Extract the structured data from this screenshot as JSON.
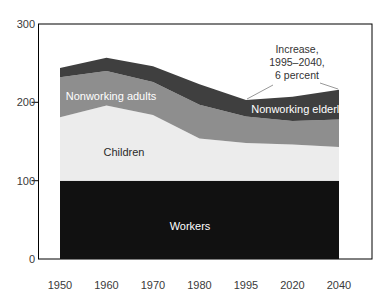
{
  "chart_data": {
    "type": "area",
    "stacked": true,
    "title": "",
    "categories": [
      "1950",
      "1960",
      "1970",
      "1980",
      "1995",
      "2020",
      "2040"
    ],
    "series": [
      {
        "name": "Workers",
        "values": [
          100,
          100,
          100,
          100,
          100,
          100,
          100
        ],
        "color": "#111111",
        "label_color": "#ffffff"
      },
      {
        "name": "Children",
        "values": [
          81,
          96,
          84,
          54,
          48,
          46,
          43
        ],
        "color": "#ececec",
        "label_color": "#2a2a2a"
      },
      {
        "name": "Nonworking adults",
        "values": [
          51,
          44,
          42,
          43,
          34,
          30,
          35
        ],
        "color": "#8e8e8e",
        "label_color": "#ffffff"
      },
      {
        "name": "Nonworking elderly",
        "values": [
          12,
          17,
          20,
          26,
          21,
          31,
          38
        ],
        "color": "#3f3f3f",
        "label_color": "#ffffff"
      }
    ],
    "totals": [
      244,
      257,
      246,
      223,
      203,
      207,
      216
    ],
    "ylim": [
      0,
      300
    ],
    "yticks": [
      "0",
      "100",
      "200",
      "300"
    ],
    "grid": false,
    "legend": "inline-labels",
    "annotation": {
      "line1": "Increase,",
      "line2": "1995–2040,",
      "line3": "6 percent"
    },
    "axis_color": "#000000",
    "leader_line_color": "#999999"
  }
}
